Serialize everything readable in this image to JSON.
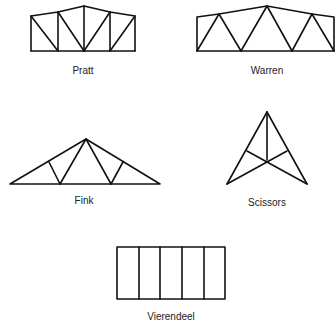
{
  "figure": {
    "type": "truss-types",
    "stroke_color": "#111111",
    "trusses": [
      {
        "name": "Pratt",
        "label": "Pratt"
      },
      {
        "name": "Warren",
        "label": "Warren"
      },
      {
        "name": "Fink",
        "label": "Fink"
      },
      {
        "name": "Scissors",
        "label": "Scissors"
      },
      {
        "name": "Vierendeel",
        "label": "Vierendeel"
      }
    ]
  }
}
